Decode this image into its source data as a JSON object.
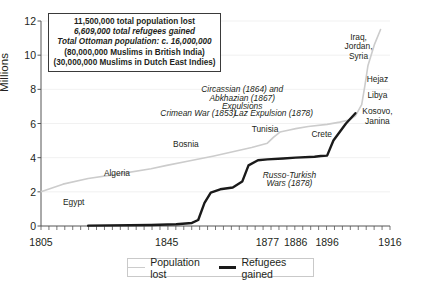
{
  "chart_data": {
    "type": "line",
    "title": "",
    "xlabel": "",
    "ylabel": "Millions",
    "xlim": [
      1805,
      1916
    ],
    "ylim": [
      0,
      12
    ],
    "yticks": [
      0,
      2,
      4,
      6,
      8,
      10,
      12
    ],
    "xticks": [
      1805,
      1845,
      1877,
      1886,
      1896,
      1916
    ],
    "grid": true,
    "legend_position": "bottom",
    "series": [
      {
        "name": "Population lost",
        "color": "#cccccc",
        "points": [
          [
            1805,
            2.0
          ],
          [
            1812,
            2.45
          ],
          [
            1820,
            2.78
          ],
          [
            1830,
            3.05
          ],
          [
            1840,
            3.35
          ],
          [
            1845,
            3.55
          ],
          [
            1852,
            3.8
          ],
          [
            1860,
            4.1
          ],
          [
            1866,
            4.35
          ],
          [
            1872,
            4.6
          ],
          [
            1877,
            4.85
          ],
          [
            1879,
            5.2
          ],
          [
            1881,
            5.5
          ],
          [
            1884,
            5.62
          ],
          [
            1886,
            5.7
          ],
          [
            1890,
            5.82
          ],
          [
            1896,
            5.95
          ],
          [
            1900,
            6.08
          ],
          [
            1903,
            6.2
          ],
          [
            1905,
            6.45
          ],
          [
            1907,
            7.1
          ],
          [
            1908,
            8.2
          ],
          [
            1909,
            9.4
          ],
          [
            1911,
            10.6
          ],
          [
            1913,
            11.5
          ]
        ]
      },
      {
        "name": "Refugees gained",
        "color": "#1a1a1a",
        "points": [
          [
            1820,
            0.02
          ],
          [
            1840,
            0.06
          ],
          [
            1848,
            0.1
          ],
          [
            1853,
            0.18
          ],
          [
            1855,
            0.35
          ],
          [
            1857,
            1.35
          ],
          [
            1859,
            1.95
          ],
          [
            1862,
            2.15
          ],
          [
            1866,
            2.25
          ],
          [
            1869,
            2.6
          ],
          [
            1871,
            3.55
          ],
          [
            1874,
            3.85
          ],
          [
            1877,
            3.9
          ],
          [
            1882,
            3.95
          ],
          [
            1886,
            4.0
          ],
          [
            1892,
            4.05
          ],
          [
            1894,
            4.1
          ],
          [
            1896,
            4.12
          ],
          [
            1898,
            5.0
          ],
          [
            1902,
            6.0
          ],
          [
            1905,
            6.6
          ]
        ]
      }
    ],
    "annotations": [
      {
        "text": "Egypt",
        "x": 1812,
        "y": 1.35,
        "italic": false,
        "align": "left"
      },
      {
        "text": "Algeria",
        "x": 1825,
        "y": 3.05,
        "italic": false,
        "align": "left"
      },
      {
        "text": "Bosnia",
        "x": 1847,
        "y": 4.75,
        "italic": false,
        "align": "left"
      },
      {
        "text": "Tunisia",
        "x": 1872,
        "y": 5.6,
        "italic": false,
        "align": "left"
      },
      {
        "text": "Crete",
        "x": 1891,
        "y": 5.3,
        "italic": false,
        "align": "left"
      },
      {
        "text": "Crimean War (1853)",
        "x": 1855,
        "y": 6.55,
        "italic": true,
        "align": "center"
      },
      {
        "text": "Laz Expulsion (1878)",
        "x": 1879,
        "y": 6.55,
        "italic": true,
        "align": "center"
      },
      {
        "text": "Circassian (1864) and",
        "x": 1869,
        "y": 7.95,
        "italic": true,
        "align": "center"
      },
      {
        "text": "Abkhazian (1867)",
        "x": 1869,
        "y": 7.45,
        "italic": true,
        "align": "center"
      },
      {
        "text": "Expulsions",
        "x": 1869,
        "y": 6.98,
        "italic": true,
        "align": "center"
      },
      {
        "text": "Russo-Turkish",
        "x": 1884,
        "y": 2.95,
        "italic": true,
        "align": "center"
      },
      {
        "text": "Wars (1878)",
        "x": 1884,
        "y": 2.45,
        "italic": true,
        "align": "center"
      },
      {
        "text": "Iraq,",
        "x": 1906,
        "y": 11.0,
        "italic": false,
        "align": "center"
      },
      {
        "text": "Jordan,",
        "x": 1906,
        "y": 10.45,
        "italic": false,
        "align": "center"
      },
      {
        "text": "Syria",
        "x": 1906,
        "y": 9.9,
        "italic": false,
        "align": "center"
      },
      {
        "text": "Hejaz",
        "x": 1912,
        "y": 8.55,
        "italic": false,
        "align": "center"
      },
      {
        "text": "Libya",
        "x": 1912,
        "y": 7.6,
        "italic": false,
        "align": "center"
      },
      {
        "text": "Kosovo,",
        "x": 1912,
        "y": 6.65,
        "italic": false,
        "align": "center"
      },
      {
        "text": "Janina",
        "x": 1912,
        "y": 6.1,
        "italic": false,
        "align": "center"
      }
    ]
  },
  "statbox": {
    "line1": "11,500,000 total population lost",
    "line2": "6,609,000 total refugees gained",
    "line3": "Total Ottoman population: c. 16,000,000",
    "line4": "(80,000,000 Muslims in British India)",
    "line5": "(30,000,000 Muslims in Dutch East Indies)"
  },
  "legend": {
    "lost_label": "Population lost",
    "refugees_label": "Refugees gained"
  }
}
